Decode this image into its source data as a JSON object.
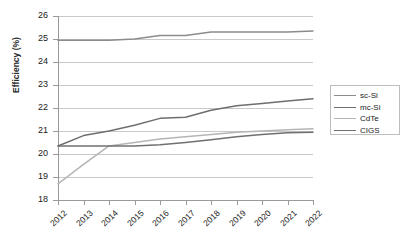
{
  "chart_data": {
    "type": "line",
    "title": "",
    "xlabel": "",
    "ylabel": "Efficiency (%)",
    "x": [
      "2012",
      "2013",
      "2014",
      "2015",
      "2016",
      "2017",
      "2018",
      "2019",
      "2020",
      "2021",
      "2022"
    ],
    "categories": [
      "2012",
      "2013",
      "2014",
      "2015",
      "2016",
      "2017",
      "2018",
      "2019",
      "2020",
      "2021",
      "2022"
    ],
    "ylim": [
      18,
      26
    ],
    "yticks": [
      18,
      19,
      20,
      21,
      22,
      23,
      24,
      25,
      26
    ],
    "ytick_labels": [
      "18",
      "19",
      "20",
      "21",
      "22",
      "23",
      "24",
      "25",
      "26"
    ],
    "grid": "horizontal",
    "legend_position": "right",
    "series": [
      {
        "name": "sc-Si",
        "color": "#8c8c8c",
        "values": [
          24.95,
          24.95,
          24.95,
          25.0,
          25.15,
          25.15,
          25.3,
          25.3,
          25.3,
          25.3,
          25.35
        ]
      },
      {
        "name": "mc-Si",
        "color": "#6e6e6e",
        "values": [
          20.35,
          20.8,
          21.0,
          21.25,
          21.55,
          21.6,
          21.9,
          22.1,
          22.2,
          22.3,
          22.4
        ]
      },
      {
        "name": "CdTe",
        "color": "#b5b5b5",
        "values": [
          18.7,
          19.55,
          20.35,
          20.5,
          20.65,
          20.75,
          20.85,
          20.95,
          21.0,
          21.05,
          21.1
        ]
      },
      {
        "name": "CIGS",
        "color": "#707070",
        "values": [
          20.35,
          20.35,
          20.35,
          20.35,
          20.4,
          20.5,
          20.62,
          20.75,
          20.85,
          20.92,
          20.95
        ]
      }
    ]
  },
  "legend": {
    "items": [
      {
        "label": "sc-Si"
      },
      {
        "label": "mc-Si"
      },
      {
        "label": "CdTe"
      },
      {
        "label": "CIGS"
      }
    ]
  }
}
